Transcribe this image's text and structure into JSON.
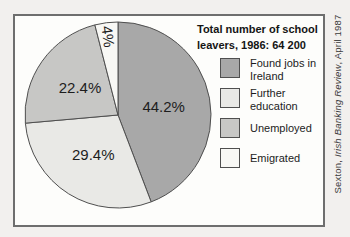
{
  "title": {
    "line1": "Total number of school",
    "line2": "leavers, 1986: 64 200"
  },
  "chart_data": {
    "type": "pie",
    "title": "Total number of school leavers, 1986: 64 200",
    "total_value_label": "64 200",
    "year": "1986",
    "start_angle_deg": 0,
    "direction": "clockwise",
    "outline_color": "#4f4f4f",
    "slices": [
      {
        "label": "Found jobs in Ireland",
        "value": 44.2,
        "display": "44.2%",
        "color": "#a8a8a8"
      },
      {
        "label": "Further education",
        "value": 29.4,
        "display": "29.4%",
        "color": "#e9e9e6"
      },
      {
        "label": "Unemployed",
        "value": 22.4,
        "display": "22.4%",
        "color": "#c7c7c5"
      },
      {
        "label": "Emigrated",
        "value": 4,
        "display": "4%",
        "color": "#f8f8f5"
      }
    ],
    "legend_position": "right"
  },
  "legend": {
    "items": [
      {
        "lines": [
          "Found jobs in",
          "Ireland"
        ]
      },
      {
        "lines": [
          "Further",
          "education"
        ]
      },
      {
        "lines": [
          "Unemployed"
        ]
      },
      {
        "lines": [
          "Emigrated"
        ]
      }
    ]
  },
  "source_note": {
    "prefix": "Sexton, ",
    "journal": "Irish Banking Review",
    "suffix": ", April 1987"
  },
  "colors": {
    "page_bg": "#f2f0ee",
    "frame_bg": "#fdfdfb",
    "frame_border": "#6e6e6e",
    "text": "#1c1c1c"
  }
}
